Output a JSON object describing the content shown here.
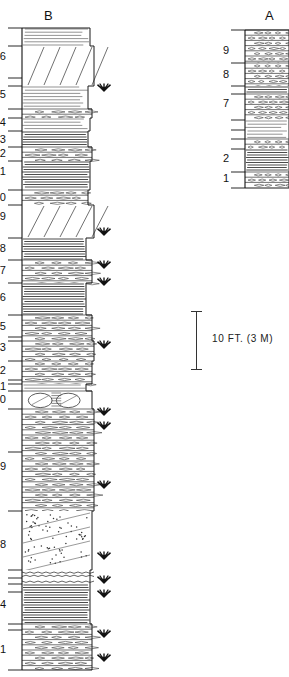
{
  "figure": {
    "type": "stratigraphic-column",
    "scale_bar": {
      "label": "10 FT. (3 M)",
      "length_ft": 10,
      "length_m": 3
    },
    "symbol_legend": {
      "plant_fossil": "plant-fossil-symbol"
    }
  },
  "columns": [
    {
      "id": "B",
      "title": "B",
      "title_x": 44,
      "title_y": 8,
      "axis": {
        "x": 22,
        "top": 28,
        "bottom": 670
      },
      "body": {
        "left": 22,
        "right": 96
      },
      "unit_labels": [
        {
          "text": "26",
          "y": 56
        },
        {
          "text": "25",
          "y": 94
        },
        {
          "text": "24",
          "y": 122
        },
        {
          "text": "23",
          "y": 139
        },
        {
          "text": "22",
          "y": 153
        },
        {
          "text": "21",
          "y": 171
        },
        {
          "text": "20",
          "y": 197
        },
        {
          "text": "19",
          "y": 216
        },
        {
          "text": "18",
          "y": 248
        },
        {
          "text": "17",
          "y": 270
        },
        {
          "text": "16",
          "y": 297
        },
        {
          "text": "15",
          "y": 326
        },
        {
          "text": "13",
          "y": 347
        },
        {
          "text": "12",
          "y": 370
        },
        {
          "text": "11",
          "y": 386
        },
        {
          "text": "10",
          "y": 399
        },
        {
          "text": "9",
          "y": 466
        },
        {
          "text": "8",
          "y": 544
        },
        {
          "text": "4",
          "y": 604
        },
        {
          "text": "1",
          "y": 649
        }
      ],
      "bed_contacts_y": [
        28,
        46,
        78,
        86,
        109,
        118,
        131,
        147,
        161,
        190,
        205,
        238,
        260,
        283,
        315,
        337,
        341,
        361,
        380,
        384,
        391,
        409,
        452,
        511,
        570,
        578,
        584,
        592,
        624,
        630,
        670
      ],
      "beds": [
        {
          "top": 28,
          "bottom": 46,
          "width": 68,
          "pattern": "shale"
        },
        {
          "top": 46,
          "bottom": 86,
          "width": 72,
          "pattern": "sandstone-cross"
        },
        {
          "top": 86,
          "bottom": 109,
          "width": 66,
          "pattern": "shale"
        },
        {
          "top": 109,
          "bottom": 118,
          "width": 70,
          "pattern": "limestone"
        },
        {
          "top": 118,
          "bottom": 131,
          "width": 68,
          "pattern": "shale"
        },
        {
          "top": 131,
          "bottom": 147,
          "width": 66,
          "pattern": "shale-dark"
        },
        {
          "top": 147,
          "bottom": 161,
          "width": 70,
          "pattern": "limestone"
        },
        {
          "top": 161,
          "bottom": 190,
          "width": 68,
          "pattern": "shale-dark"
        },
        {
          "top": 190,
          "bottom": 205,
          "width": 66,
          "pattern": "limestone"
        },
        {
          "top": 205,
          "bottom": 238,
          "width": 72,
          "pattern": "sandstone-cross"
        },
        {
          "top": 238,
          "bottom": 260,
          "width": 64,
          "pattern": "shale-dark"
        },
        {
          "top": 260,
          "bottom": 283,
          "width": 70,
          "pattern": "limestone"
        },
        {
          "top": 283,
          "bottom": 315,
          "width": 64,
          "pattern": "shale-dark"
        },
        {
          "top": 315,
          "bottom": 341,
          "width": 70,
          "pattern": "limestone"
        },
        {
          "top": 341,
          "bottom": 361,
          "width": 72,
          "pattern": "limestone"
        },
        {
          "top": 361,
          "bottom": 384,
          "width": 70,
          "pattern": "limestone"
        },
        {
          "top": 384,
          "bottom": 391,
          "width": 64,
          "pattern": "shale"
        },
        {
          "top": 391,
          "bottom": 409,
          "width": 70,
          "pattern": "concretion"
        },
        {
          "top": 409,
          "bottom": 511,
          "width": 72,
          "pattern": "limestone"
        },
        {
          "top": 511,
          "bottom": 570,
          "width": 70,
          "pattern": "sandstone-dotted"
        },
        {
          "top": 570,
          "bottom": 584,
          "width": 68,
          "pattern": "wavy-bed"
        },
        {
          "top": 584,
          "bottom": 624,
          "width": 68,
          "pattern": "shale-dark"
        },
        {
          "top": 624,
          "bottom": 670,
          "width": 70,
          "pattern": "limestone"
        }
      ],
      "fossil_symbols_y": [
        88,
        232,
        265,
        282,
        345,
        412,
        426,
        485,
        556,
        580,
        594,
        634,
        658
      ]
    },
    {
      "id": "A",
      "title": "A",
      "title_x": 265,
      "title_y": 8,
      "axis": {
        "x": 245,
        "top": 30,
        "bottom": 188
      },
      "body": {
        "left": 245,
        "right": 289
      },
      "unit_labels": [
        {
          "text": "9",
          "y": 50
        },
        {
          "text": "8",
          "y": 74
        },
        {
          "text": "7",
          "y": 103
        },
        {
          "text": "2",
          "y": 158
        },
        {
          "text": "1",
          "y": 178
        }
      ],
      "bed_contacts_y": [
        30,
        63,
        86,
        94,
        120,
        130,
        139,
        149,
        172,
        188
      ],
      "beds": [
        {
          "top": 30,
          "bottom": 63,
          "width": 44,
          "pattern": "limestone"
        },
        {
          "top": 63,
          "bottom": 86,
          "width": 44,
          "pattern": "limestone"
        },
        {
          "top": 86,
          "bottom": 94,
          "width": 44,
          "pattern": "shale-dark"
        },
        {
          "top": 94,
          "bottom": 120,
          "width": 44,
          "pattern": "limestone"
        },
        {
          "top": 120,
          "bottom": 130,
          "width": 44,
          "pattern": "shale"
        },
        {
          "top": 130,
          "bottom": 139,
          "width": 44,
          "pattern": "shale"
        },
        {
          "top": 139,
          "bottom": 149,
          "width": 44,
          "pattern": "limestone"
        },
        {
          "top": 149,
          "bottom": 172,
          "width": 44,
          "pattern": "shale-dark"
        },
        {
          "top": 172,
          "bottom": 188,
          "width": 44,
          "pattern": "limestone"
        }
      ],
      "fossil_symbols_y": []
    }
  ]
}
